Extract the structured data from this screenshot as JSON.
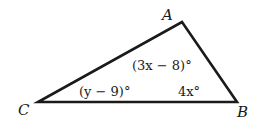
{
  "diagram": {
    "type": "triangle",
    "vertices": {
      "A": {
        "label": "A"
      },
      "B": {
        "label": "B"
      },
      "C": {
        "label": "C"
      }
    },
    "angles": {
      "A": "(3x − 8)°",
      "B": "4x°",
      "C": "(y − 9)°"
    },
    "stroke_color": "#1a1a1a"
  }
}
